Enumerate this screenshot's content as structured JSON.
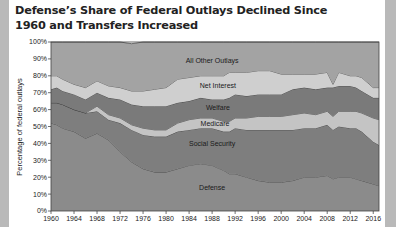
{
  "title": "Defense’s Share of Federal Outlays Declined Since 1960 and Transfers Increased",
  "chart_data": {
    "type": "area",
    "stacked": true,
    "title": "Defense’s Share of Federal Outlays Declined Since 1960 and Transfers Increased",
    "xlabel": "",
    "ylabel": "Percentage of federal outlays",
    "ylim": [
      0,
      100
    ],
    "xlim": [
      1960,
      2017
    ],
    "x_ticks": [
      1960,
      1964,
      1968,
      1972,
      1976,
      1980,
      1984,
      1988,
      1992,
      1996,
      2000,
      2004,
      2008,
      2012,
      2016
    ],
    "y_ticks": [
      "0%",
      "10%",
      "20%",
      "30%",
      "40%",
      "50%",
      "60%",
      "70%",
      "80%",
      "90%",
      "100%"
    ],
    "grid": false,
    "legend": "inline labels on bands",
    "x": [
      1960,
      1961,
      1962,
      1964,
      1966,
      1968,
      1970,
      1972,
      1974,
      1976,
      1978,
      1980,
      1982,
      1984,
      1986,
      1988,
      1990,
      1991,
      1992,
      1994,
      1996,
      1998,
      2000,
      2002,
      2004,
      2006,
      2008,
      2009,
      2010,
      2012,
      2013,
      2014,
      2016,
      2017
    ],
    "series": [
      {
        "name": "Defense",
        "values": [
          52,
          51,
          49,
          47,
          43,
          46,
          42,
          35,
          29,
          25,
          23,
          23,
          25,
          27,
          28,
          27,
          24,
          22,
          22,
          20,
          18,
          17,
          17,
          18,
          20,
          20,
          21,
          19,
          20,
          20,
          19,
          18,
          16,
          15
        ]
      },
      {
        "name": "Social Security",
        "values": [
          12,
          13,
          14,
          13,
          15,
          13,
          12,
          17,
          19,
          20,
          21,
          21,
          22,
          21,
          21,
          22,
          23,
          25,
          27,
          28,
          30,
          31,
          31,
          30,
          29,
          29,
          30,
          29,
          30,
          29,
          30,
          29,
          25,
          24
        ]
      },
      {
        "name": "Medicare",
        "values": [
          0,
          0,
          0,
          0,
          0,
          3,
          3,
          3,
          3,
          4,
          4,
          4,
          5,
          6,
          6,
          6,
          6,
          6,
          6,
          7,
          8,
          8,
          8,
          9,
          9,
          8,
          8,
          8,
          9,
          10,
          10,
          11,
          14,
          15
        ]
      },
      {
        "name": "Welfare",
        "values": [
          8,
          9,
          8,
          9,
          8,
          8,
          10,
          11,
          12,
          13,
          14,
          14,
          12,
          11,
          12,
          11,
          13,
          14,
          14,
          13,
          13,
          13,
          13,
          15,
          15,
          15,
          14,
          17,
          15,
          15,
          14,
          13,
          12,
          13
        ]
      },
      {
        "name": "Net Interest",
        "values": [
          8,
          7,
          7,
          6,
          7,
          7,
          7,
          7,
          8,
          9,
          10,
          11,
          14,
          14,
          13,
          14,
          14,
          15,
          13,
          14,
          14,
          14,
          12,
          9,
          8,
          9,
          9,
          2,
          8,
          6,
          7,
          8,
          6,
          6
        ]
      },
      {
        "name": "All Other Outlays",
        "values": [
          20,
          20,
          22,
          25,
          27,
          23,
          26,
          27,
          28,
          29,
          28,
          27,
          22,
          21,
          20,
          20,
          20,
          18,
          18,
          18,
          17,
          17,
          19,
          19,
          19,
          19,
          18,
          25,
          18,
          20,
          20,
          21,
          27,
          27
        ]
      }
    ],
    "colors": {
      "Defense": "#8b8b8b",
      "Social Security": "#7e7e7e",
      "Medicare": "#c4c4c4",
      "Welfare": "#7a7a7a",
      "Net Interest": "#cfcfcf",
      "All Other Outlays": "#a3a3a3"
    },
    "band_labels": [
      {
        "name": "All Other Outlays",
        "x": 1988,
        "y": 89
      },
      {
        "name": "Net Interest",
        "x": 1989,
        "y": 74
      },
      {
        "name": "Welfare",
        "x": 1989,
        "y": 61
      },
      {
        "name": "Medicare",
        "x": 1988.5,
        "y": 52
      },
      {
        "name": "Social Security",
        "x": 1988,
        "y": 40
      },
      {
        "name": "Defense",
        "x": 1988,
        "y": 14
      }
    ]
  }
}
